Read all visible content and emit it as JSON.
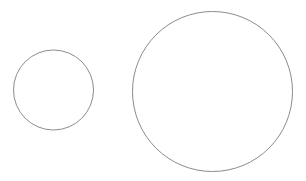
{
  "canvas": {
    "width": 306,
    "height": 181,
    "background": "#ffffff"
  },
  "shapes": [
    {
      "id": "small-circle",
      "type": "circle",
      "cx": 53.5,
      "cy": 90,
      "r": 40,
      "stroke": "#8c8c8c",
      "stroke_width": 1,
      "fill": "none"
    },
    {
      "id": "large-circle",
      "type": "circle",
      "cx": 212.5,
      "cy": 91.5,
      "r": 80,
      "stroke": "#8c8c8c",
      "stroke_width": 1,
      "fill": "none"
    }
  ]
}
